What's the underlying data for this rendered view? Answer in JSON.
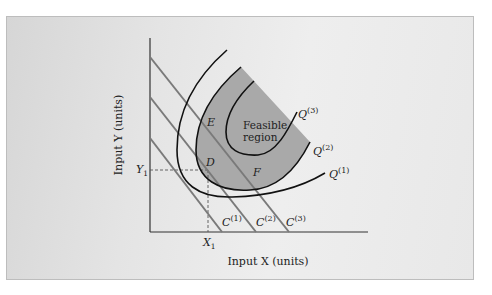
{
  "figure": {
    "y_axis_label": "Input Y (units)",
    "x_axis_label": "Input X (units)",
    "region_label_line1": "Feasible",
    "region_label_line2": "region",
    "points": {
      "E": "E",
      "D": "D",
      "F": "F"
    },
    "x_marker": {
      "base": "X",
      "sub": "1"
    },
    "y_marker": {
      "base": "Y",
      "sub": "1"
    },
    "isocost_labels": [
      {
        "base": "C",
        "sup": "(1)"
      },
      {
        "base": "C",
        "sup": "(2)"
      },
      {
        "base": "C",
        "sup": "(3)"
      }
    ],
    "isoquant_labels": [
      {
        "base": "Q",
        "sup": "(1)"
      },
      {
        "base": "Q",
        "sup": "(2)"
      },
      {
        "base": "Q",
        "sup": "(3)"
      }
    ],
    "colors": {
      "region_fill": "#a9a9a9",
      "isocost_line": "#7a7a7a",
      "isoquant_line": "#111111",
      "axis": "#333333"
    }
  }
}
